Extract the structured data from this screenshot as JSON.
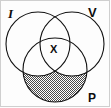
{
  "figure": {
    "type": "venn-diagram",
    "set_count": 3,
    "background_color": "#fdfdfd",
    "stroke_color": "#111111",
    "shading_color": "#8a8a8a",
    "border_color": "#cfcfcf",
    "labels": {
      "set_top_left": "I",
      "set_top_right": "V",
      "set_bottom": "P",
      "center_region": "X"
    },
    "circles": [
      {
        "id": "I",
        "label": "I",
        "cx": 38,
        "cy": 44,
        "r": 32
      },
      {
        "id": "V",
        "label": "V",
        "cx": 72,
        "cy": 44,
        "r": 32
      },
      {
        "id": "P",
        "label": "P",
        "cx": 55,
        "cy": 70,
        "r": 32
      }
    ],
    "shaded_regions": [
      "P-only",
      "P-intersect-I-minus-V",
      "P-intersect-V-minus-I"
    ],
    "unshaded_regions": [
      "I-only",
      "V-only",
      "I-intersect-V-minus-P",
      "I-intersect-V-intersect-P"
    ]
  }
}
